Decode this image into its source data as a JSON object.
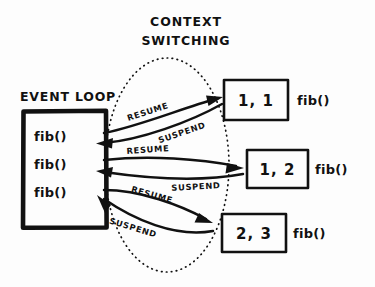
{
  "diagram": {
    "title_line1": "CONTEXT",
    "title_line2": "SWITCHING",
    "colors": {
      "ink": "#111111",
      "background": "#fdfdfd"
    },
    "event_loop": {
      "label": "EVENT LOOP",
      "tasks": [
        {
          "label": "fib()"
        },
        {
          "label": "fib()"
        },
        {
          "label": "fib()"
        }
      ]
    },
    "coroutines": [
      {
        "value": "1, 1",
        "label": "fib()"
      },
      {
        "value": "1, 2",
        "label": "fib()"
      },
      {
        "value": "2, 3",
        "label": "fib()"
      }
    ],
    "transitions": [
      {
        "resume": "RESUME",
        "suspend": "SUSPEND"
      },
      {
        "resume": "RESUME",
        "suspend": "SUSPEND"
      },
      {
        "resume": "RESUME",
        "suspend": "SUSPEND"
      }
    ]
  }
}
